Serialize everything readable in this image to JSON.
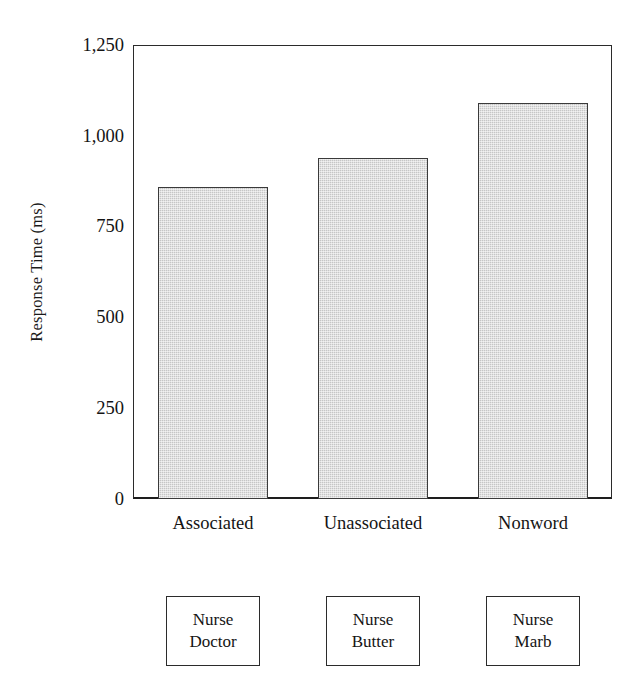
{
  "chart_data": {
    "type": "bar",
    "title": "",
    "xlabel": "",
    "ylabel": "Response Time (ms)",
    "categories": [
      "Associated",
      "Unassociated",
      "Nonword"
    ],
    "values": [
      860,
      940,
      1090
    ],
    "ylim": [
      0,
      1250
    ],
    "yticks": [
      0,
      250,
      500,
      750,
      1000,
      1250
    ],
    "ytick_labels": [
      "0",
      "250",
      "500",
      "750",
      "1,000",
      "1,250"
    ],
    "grid": false,
    "legend": null,
    "bar_fill_color": "#c6c6c6",
    "bar_edge_color": "#3a3a3a",
    "axis_color": "#2b2b2b",
    "background_color": "#ffffff"
  },
  "stimulus_boxes": [
    {
      "prime": "Nurse",
      "target": "Doctor"
    },
    {
      "prime": "Nurse",
      "target": "Butter"
    },
    {
      "prime": "Nurse",
      "target": "Marb"
    }
  ]
}
